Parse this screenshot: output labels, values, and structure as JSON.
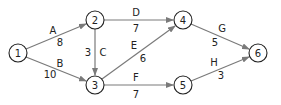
{
  "diagram": {
    "type": "directed-network",
    "nodes": [
      {
        "id": "1",
        "label": "1",
        "x": 18,
        "y": 53
      },
      {
        "id": "2",
        "label": "2",
        "x": 95,
        "y": 20
      },
      {
        "id": "3",
        "label": "3",
        "x": 95,
        "y": 85
      },
      {
        "id": "4",
        "label": "4",
        "x": 183,
        "y": 20
      },
      {
        "id": "5",
        "label": "5",
        "x": 183,
        "y": 85
      },
      {
        "id": "6",
        "label": "6",
        "x": 258,
        "y": 53
      }
    ],
    "edges": [
      {
        "name": "A",
        "from": "1",
        "to": "2",
        "weight": "8"
      },
      {
        "name": "B",
        "from": "1",
        "to": "3",
        "weight": "10"
      },
      {
        "name": "C",
        "from": "2",
        "to": "3",
        "weight": "3"
      },
      {
        "name": "D",
        "from": "2",
        "to": "4",
        "weight": "7"
      },
      {
        "name": "E",
        "from": "3",
        "to": "4",
        "weight": "6"
      },
      {
        "name": "F",
        "from": "3",
        "to": "5",
        "weight": "7"
      },
      {
        "name": "G",
        "from": "4",
        "to": "6",
        "weight": "5"
      },
      {
        "name": "H",
        "from": "5",
        "to": "6",
        "weight": "3"
      }
    ],
    "colors": {
      "edge": "#7a7a7a",
      "node_stroke": "#222222",
      "text": "#222222"
    }
  }
}
